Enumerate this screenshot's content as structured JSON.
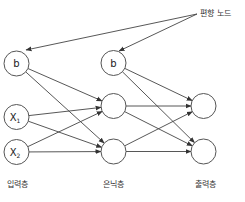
{
  "diagram": {
    "title": "",
    "annotation": {
      "text": "편향 노드",
      "x": 200,
      "y": 16,
      "origin": {
        "x": 197,
        "y": 14
      },
      "targets": [
        {
          "x": 26,
          "y": 50
        },
        {
          "x": 119,
          "y": 51
        }
      ]
    },
    "layers": [
      {
        "id": "input",
        "label": "입력층",
        "label_x": 17
      },
      {
        "id": "hidden",
        "label": "은닉층",
        "label_x": 113
      },
      {
        "id": "output",
        "label": "출력층",
        "label_x": 205
      }
    ],
    "layer_label_y": 187,
    "node_radius": 12.5,
    "nodes": [
      {
        "id": "in_b",
        "layer": "input",
        "label": "b",
        "sub": "",
        "cx": 16.5,
        "cy": 63.5
      },
      {
        "id": "in_x1",
        "layer": "input",
        "label": "X",
        "sub": "1",
        "cx": 16.5,
        "cy": 117
      },
      {
        "id": "in_x2",
        "layer": "input",
        "label": "X",
        "sub": "2",
        "cx": 16.5,
        "cy": 152
      },
      {
        "id": "hid_b",
        "layer": "hidden",
        "label": "b",
        "sub": "",
        "cx": 113.5,
        "cy": 63
      },
      {
        "id": "hid_1",
        "layer": "hidden",
        "label": "",
        "sub": "",
        "cx": 113.5,
        "cy": 106
      },
      {
        "id": "hid_2",
        "layer": "hidden",
        "label": "",
        "sub": "",
        "cx": 113.5,
        "cy": 151.5
      },
      {
        "id": "out_1",
        "layer": "output",
        "label": "",
        "sub": "",
        "cx": 203.5,
        "cy": 106
      },
      {
        "id": "out_2",
        "layer": "output",
        "label": "",
        "sub": "",
        "cx": 203.5,
        "cy": 151.5
      }
    ],
    "edges": [
      {
        "from": "in_b",
        "to": "hid_1"
      },
      {
        "from": "in_b",
        "to": "hid_2"
      },
      {
        "from": "in_x1",
        "to": "hid_1"
      },
      {
        "from": "in_x1",
        "to": "hid_2"
      },
      {
        "from": "in_x2",
        "to": "hid_1"
      },
      {
        "from": "in_x2",
        "to": "hid_2"
      },
      {
        "from": "hid_b",
        "to": "out_1"
      },
      {
        "from": "hid_b",
        "to": "out_2"
      },
      {
        "from": "hid_1",
        "to": "out_1"
      },
      {
        "from": "hid_1",
        "to": "out_2"
      },
      {
        "from": "hid_2",
        "to": "out_1"
      },
      {
        "from": "hid_2",
        "to": "out_2"
      }
    ],
    "colors": {
      "stroke": "#555555",
      "edge": "#444444",
      "text": "#222222",
      "background": "#ffffff"
    }
  }
}
